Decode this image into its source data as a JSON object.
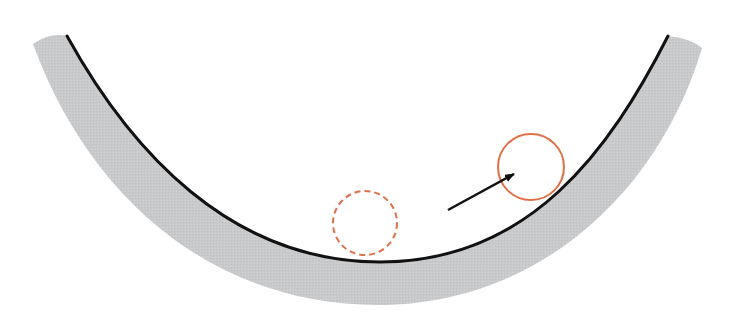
{
  "diagram": {
    "colors": {
      "background": "#ffffff",
      "bowl_fill": "#c9cacc",
      "bowl_surface_line": "#111111",
      "ball_outline": "#e0704a",
      "arrow": "#111111"
    },
    "bowl": {
      "inner_curve_left_top": [
        67,
        36
      ],
      "inner_curve_bottom": [
        380,
        262
      ],
      "inner_curve_right_top": [
        668,
        36
      ]
    },
    "balls": [
      {
        "id": "equilibrium-ball",
        "style": "dashed",
        "cx": 365,
        "cy": 223,
        "r": 32
      },
      {
        "id": "displaced-ball",
        "style": "solid",
        "cx": 531,
        "cy": 167,
        "r": 33
      }
    ],
    "arrow": {
      "from": [
        448,
        210
      ],
      "to": [
        514,
        174
      ]
    }
  }
}
